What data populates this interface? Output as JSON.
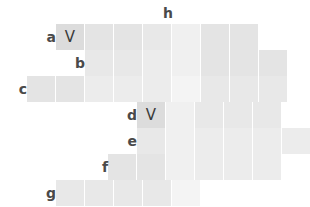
{
  "grid": {
    "cell_width": 28,
    "cell_height": 26,
    "col_x": [
      27,
      56,
      85,
      108,
      137,
      166,
      195,
      224,
      253,
      282
    ],
    "row_y": [
      24,
      50,
      76,
      102,
      128,
      154,
      180
    ],
    "palette": {
      "light_gray": "#dcdcdc",
      "pale_gray": "#ececec",
      "lightest_gray": "#f4f4f4",
      "label_gray": "#4a4a4a",
      "mark_gray": "#3a3a3a",
      "background": "#ffffff"
    }
  },
  "labels": {
    "rows": [
      {
        "text": "a",
        "x": 40,
        "y": 24
      },
      {
        "text": "b",
        "x": 69,
        "y": 50
      },
      {
        "text": "c",
        "x": 11,
        "y": 76
      },
      {
        "text": "d",
        "x": 121,
        "y": 102
      },
      {
        "text": "e",
        "x": 121,
        "y": 128
      },
      {
        "text": "f",
        "x": 92,
        "y": 154
      },
      {
        "text": "g",
        "x": 40,
        "y": 180
      }
    ],
    "columns": [
      {
        "text": "h",
        "x": 160,
        "y": 4
      }
    ]
  },
  "marks": [
    {
      "text": "V",
      "x": 56,
      "y": 24
    },
    {
      "text": "V",
      "x": 137,
      "y": 102
    }
  ],
  "rows": [
    {
      "name": "a",
      "cells": [
        {
          "x": 56,
          "y": 24,
          "tone": "tone-a"
        },
        {
          "x": 85,
          "y": 24,
          "tone": "tone-c"
        },
        {
          "x": 114,
          "y": 24,
          "tone": "tone-c"
        },
        {
          "x": 143,
          "y": 24,
          "tone": "tone-d"
        },
        {
          "x": 172,
          "y": 24,
          "tone": "tone-f"
        },
        {
          "x": 201,
          "y": 24,
          "tone": "tone-c"
        },
        {
          "x": 230,
          "y": 24,
          "tone": "tone-c"
        }
      ]
    },
    {
      "name": "b",
      "cells": [
        {
          "x": 85,
          "y": 50,
          "tone": "tone-d"
        },
        {
          "x": 114,
          "y": 50,
          "tone": "tone-d"
        },
        {
          "x": 143,
          "y": 50,
          "tone": "tone-e"
        },
        {
          "x": 172,
          "y": 50,
          "tone": "tone-f"
        },
        {
          "x": 201,
          "y": 50,
          "tone": "tone-c"
        },
        {
          "x": 230,
          "y": 50,
          "tone": "tone-c"
        },
        {
          "x": 259,
          "y": 50,
          "tone": "tone-c"
        }
      ]
    },
    {
      "name": "c",
      "cells": [
        {
          "x": 27,
          "y": 76,
          "tone": "tone-c"
        },
        {
          "x": 56,
          "y": 76,
          "tone": "tone-c"
        },
        {
          "x": 85,
          "y": 76,
          "tone": "tone-e"
        },
        {
          "x": 114,
          "y": 76,
          "tone": "tone-e"
        },
        {
          "x": 143,
          "y": 76,
          "tone": "tone-e"
        },
        {
          "x": 172,
          "y": 76,
          "tone": "tone-g"
        },
        {
          "x": 201,
          "y": 76,
          "tone": "tone-d"
        },
        {
          "x": 230,
          "y": 76,
          "tone": "tone-d"
        },
        {
          "x": 259,
          "y": 76,
          "tone": "tone-d"
        }
      ]
    },
    {
      "name": "d",
      "cells": [
        {
          "x": 137,
          "y": 102,
          "tone": "tone-a"
        },
        {
          "x": 166,
          "y": 102,
          "tone": "tone-f"
        },
        {
          "x": 195,
          "y": 102,
          "tone": "tone-d"
        },
        {
          "x": 224,
          "y": 102,
          "tone": "tone-d"
        },
        {
          "x": 253,
          "y": 102,
          "tone": "tone-d"
        }
      ]
    },
    {
      "name": "e",
      "cells": [
        {
          "x": 137,
          "y": 128,
          "tone": "tone-d"
        },
        {
          "x": 166,
          "y": 128,
          "tone": "tone-f"
        },
        {
          "x": 195,
          "y": 128,
          "tone": "tone-e"
        },
        {
          "x": 224,
          "y": 128,
          "tone": "tone-e"
        },
        {
          "x": 253,
          "y": 128,
          "tone": "tone-e"
        },
        {
          "x": 282,
          "y": 128,
          "tone": "tone-e"
        }
      ]
    },
    {
      "name": "f",
      "cells": [
        {
          "x": 108,
          "y": 154,
          "tone": "tone-c"
        },
        {
          "x": 137,
          "y": 154,
          "tone": "tone-c"
        },
        {
          "x": 166,
          "y": 154,
          "tone": "tone-f"
        },
        {
          "x": 195,
          "y": 154,
          "tone": "tone-e"
        },
        {
          "x": 224,
          "y": 154,
          "tone": "tone-e"
        },
        {
          "x": 253,
          "y": 154,
          "tone": "tone-e"
        }
      ]
    },
    {
      "name": "g",
      "cells": [
        {
          "x": 56,
          "y": 180,
          "tone": "tone-d"
        },
        {
          "x": 85,
          "y": 180,
          "tone": "tone-d"
        },
        {
          "x": 114,
          "y": 180,
          "tone": "tone-d"
        },
        {
          "x": 143,
          "y": 180,
          "tone": "tone-d"
        },
        {
          "x": 172,
          "y": 180,
          "tone": "tone-g"
        }
      ]
    }
  ]
}
